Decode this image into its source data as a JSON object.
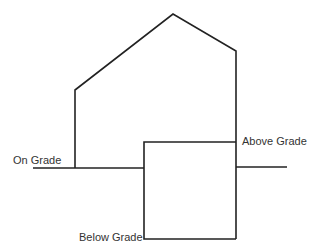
{
  "diagram": {
    "type": "building-grade-section",
    "stroke_color": "#222222",
    "labels": {
      "on_grade": "On Grade",
      "above_grade": "Above Grade",
      "below_grade": "Below Grade"
    }
  }
}
